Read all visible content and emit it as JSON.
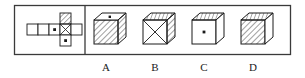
{
  "figure": {
    "kind": "cube-folding-puzzle",
    "outer_box": {
      "stroke": "#3a3a3a",
      "fill": "#ffffff"
    },
    "divider_x": 85,
    "net_panel": {
      "label": "cube-net",
      "cell_size": 11,
      "cells": [
        {
          "id": "net-cell-1",
          "col": 0,
          "row": 1,
          "face": "blank"
        },
        {
          "id": "net-cell-2",
          "col": 1,
          "row": 1,
          "face": "blank"
        },
        {
          "id": "net-cell-3",
          "col": 2,
          "row": 1,
          "face": "dot"
        },
        {
          "id": "net-cell-4",
          "col": 3,
          "row": 1,
          "face": "cross"
        },
        {
          "id": "net-cell-5",
          "col": 4,
          "row": 0,
          "face": "hatch"
        },
        {
          "id": "net-cell-6",
          "col": 4,
          "row": 1,
          "face": "blank"
        },
        {
          "id": "net-cell-7",
          "col": 4,
          "row": 2,
          "face": "dot"
        }
      ]
    },
    "options": [
      {
        "id": "option-a",
        "label": "A",
        "front_face": "hatch",
        "top_face": "dot",
        "right_face": "hatch"
      },
      {
        "id": "option-b",
        "label": "B",
        "front_face": "cross",
        "top_face": "hatch",
        "right_face": "hatch"
      },
      {
        "id": "option-c",
        "label": "C",
        "front_face": "dot",
        "top_face": "hatch",
        "right_face": "blank"
      },
      {
        "id": "option-d",
        "label": "D",
        "front_face": "hatch",
        "top_face": "hatch",
        "right_face": "blank"
      }
    ],
    "colors": {
      "ink": "#1a1a1a",
      "box_border": "#3a3a3a",
      "paper": "#ffffff",
      "hatch_line": "#2b2b2b"
    }
  }
}
